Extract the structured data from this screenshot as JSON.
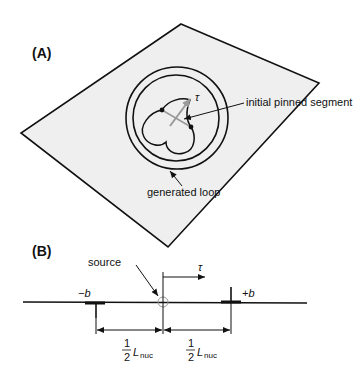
{
  "panel_a": {
    "label": "(A)",
    "tau_symbol": "τ",
    "annotations": {
      "pinned_segment": "initial pinned segment",
      "generated_loop": "generated loop"
    },
    "colors": {
      "plane_fill": "#efefef",
      "stroke": "#111111",
      "tau_arrow": "#9a9a9a"
    }
  },
  "panel_b": {
    "label": "(B)",
    "source_label": "source",
    "tau_symbol": "τ",
    "neg_b_label": "−b",
    "pos_b_label": "+b",
    "half_numerator": "1",
    "half_denominator": "2",
    "length_symbol": "L",
    "length_subscript": "nuc",
    "colors": {
      "source_marker": "#999999",
      "stroke": "#111111"
    }
  }
}
